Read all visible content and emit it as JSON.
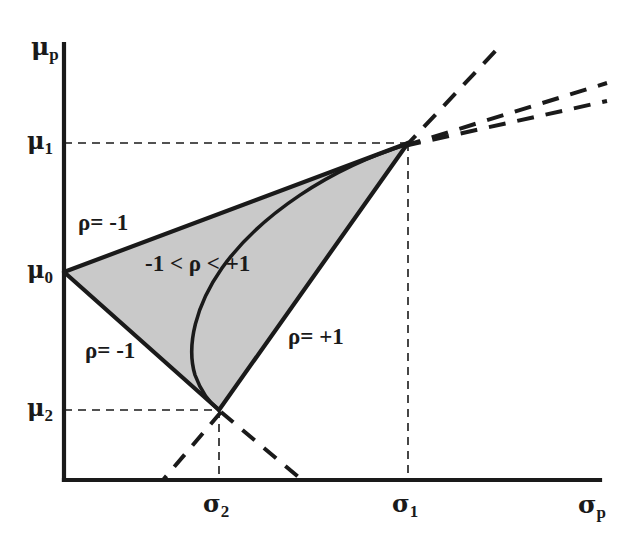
{
  "figure": {
    "type": "diagram",
    "background_color": "#ffffff",
    "line_color": "#1a1a1a",
    "fill_color": "#c9c9c9"
  },
  "axes": {
    "y_axis_label": "μ",
    "y_axis_sub": "p",
    "x_axis_label": "σ",
    "x_axis_sub": "p",
    "origin_px": {
      "x": 64,
      "y": 480
    },
    "x_axis_end_px": {
      "x": 600,
      "y": 480
    },
    "y_axis_top_px": {
      "x": 64,
      "y": 44
    }
  },
  "y_ticks": [
    {
      "label": "μ",
      "sub": "1",
      "y_px": 143,
      "dashed_guide": true
    },
    {
      "label": "μ",
      "sub": "0",
      "y_px": 272,
      "dashed_guide": false
    },
    {
      "label": "μ",
      "sub": "2",
      "y_px": 410,
      "dashed_guide": true
    }
  ],
  "x_ticks": [
    {
      "label": "σ",
      "sub": "2",
      "x_px": 219,
      "dashed_guide": true
    },
    {
      "label": "σ",
      "sub": "1",
      "x_px": 408,
      "dashed_guide": true
    }
  ],
  "vertices": {
    "asset_1": {
      "name": "asset-1-point",
      "x_px": 408,
      "y_px": 143,
      "mu": "μ1",
      "sigma": "σ1"
    },
    "intercept_0": {
      "name": "mu0-intercept",
      "x_px": 64,
      "y_px": 272,
      "mu": "μ0",
      "sigma": "0"
    },
    "asset_2": {
      "name": "asset-2-point",
      "x_px": 219,
      "y_px": 410,
      "mu": "μ2",
      "sigma": "σ2"
    }
  },
  "annotations": [
    {
      "id": "rho-neg-one-upper",
      "text": "ρ= -1",
      "x_px": 78,
      "y_px": 211
    },
    {
      "id": "rho-range",
      "text": "-1 < ρ < +1",
      "x_px": 145,
      "y_px": 252
    },
    {
      "id": "rho-neg-one-lower",
      "text": "ρ= -1",
      "x_px": 85,
      "y_px": 339
    },
    {
      "id": "rho-pos-one",
      "text": "ρ= +1",
      "x_px": 288,
      "y_px": 325
    }
  ],
  "curves": {
    "efficient_frontier": {
      "name": "interior-correlation-curve",
      "note": "solid curve bulging left, from asset-1 apex to asset-2 vertex"
    },
    "rho_neg_one_upper_segment": {
      "from": "intercept_0",
      "to": "asset_1"
    },
    "rho_neg_one_lower_segment": {
      "from": "intercept_0",
      "to": "asset_2"
    },
    "rho_pos_one_segment": {
      "from": "asset_2",
      "to": "asset_1"
    }
  },
  "dashed_extensions": [
    {
      "id": "ext-steep",
      "from_px": {
        "x": 408,
        "y": 143
      },
      "to_px": {
        "x": 500,
        "y": 45
      }
    },
    {
      "id": "ext-mid",
      "from_px": {
        "x": 408,
        "y": 143
      },
      "to_px": {
        "x": 600,
        "y": 85
      }
    },
    {
      "id": "ext-shallow",
      "from_px": {
        "x": 408,
        "y": 143
      },
      "to_px": {
        "x": 600,
        "y": 100
      }
    },
    {
      "id": "ext-below-left",
      "from_px": {
        "x": 219,
        "y": 410
      },
      "to_px": {
        "x": 163,
        "y": 480
      }
    },
    {
      "id": "ext-below-right",
      "from_px": {
        "x": 219,
        "y": 410
      },
      "to_px": {
        "x": 300,
        "y": 480
      }
    }
  ]
}
